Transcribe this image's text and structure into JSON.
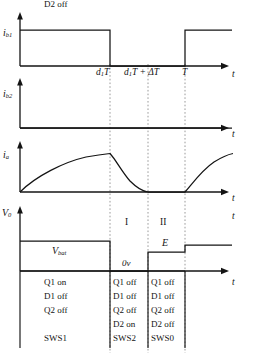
{
  "figure": {
    "kind": "timing-waveform-diagram",
    "colors": {
      "ink": "#141414",
      "dotted": "#8a8a8a",
      "background": "#ffffff"
    },
    "time_markers": [
      {
        "id": "d1T",
        "label_main": "d",
        "label_sub": "1",
        "label_tail": "T",
        "x": 110
      },
      {
        "id": "d1T_dT",
        "label_main": "d",
        "label_sub": "1",
        "label_tail": "T + ΔT",
        "x": 148
      },
      {
        "id": "T",
        "label_main": "T",
        "label_sub": "",
        "label_tail": "",
        "x": 185
      }
    ],
    "axis_t_label": "t"
  },
  "traces": [
    {
      "name": "ib1",
      "y_axis_label_main": "i",
      "y_axis_label_sub": "b1",
      "t_label": "t",
      "description": "gate drive pulse, high from 0 to d1T, low until T, high after T",
      "segments": [
        {
          "from": 0.0,
          "to": 0.5,
          "level": "high"
        },
        {
          "from": 0.5,
          "to": 1.0,
          "level": "low"
        },
        {
          "from": 1.0,
          "to": 1.3,
          "level": "high"
        }
      ],
      "tick_labels": [
        "d1T",
        "d1T + ΔT",
        "T"
      ]
    },
    {
      "name": "ib2",
      "y_axis_label_main": "i",
      "y_axis_label_sub": "b2",
      "t_label": "t",
      "description": "second gate drive, remains at zero for whole period",
      "segments": [
        {
          "from": 0.0,
          "to": 1.3,
          "level": "low"
        }
      ]
    },
    {
      "name": "ia",
      "y_axis_label_main": "i",
      "y_axis_label_sub": "a",
      "t_label": "t",
      "description": "inductor current: exponential rise 0 to d1T, exponential decay to zero at d1T+dT, zero until T, exponential rise after T",
      "phases": [
        {
          "phase": "rise",
          "start_t": 0.0,
          "end_t": 0.5,
          "start_value": 0.0,
          "end_value": 1.0
        },
        {
          "phase": "decay",
          "start_t": 0.5,
          "end_t": 0.72,
          "start_value": 1.0,
          "end_value": 0.0
        },
        {
          "phase": "zero",
          "start_t": 0.72,
          "end_t": 1.0,
          "start_value": 0.0,
          "end_value": 0.0
        },
        {
          "phase": "rise",
          "start_t": 1.0,
          "end_t": 1.3,
          "start_value": 0.0,
          "end_value": 1.0
        }
      ]
    },
    {
      "name": "v0",
      "y_axis_label_main": "V",
      "y_axis_label_sub": "0",
      "t_label": "t",
      "description": "output voltage: V_bat level until d1T, 0v until d1T+dT, E level until T, then higher level",
      "levels": [
        {
          "label": "V_bat",
          "from_t": 0.0,
          "to_t": 0.5
        },
        {
          "label": "0v",
          "from_t": 0.5,
          "to_t": 0.72
        },
        {
          "label": "E",
          "from_t": 0.72,
          "to_t": 1.0
        },
        {
          "label": "",
          "from_t": 1.0,
          "to_t": 1.3
        }
      ],
      "annotations": {
        "vbat_main": "V",
        "vbat_sub": "bat",
        "zero_volt": "0v",
        "e_level": "E"
      }
    }
  ],
  "regions": [
    {
      "id": "region-I",
      "label": "I"
    },
    {
      "id": "region-II",
      "label": "II"
    }
  ],
  "switch_table": {
    "columns": [
      {
        "id": "col-1",
        "region": "0 to d1T",
        "rows": [
          "Q1 on",
          "D1 off",
          "Q2 off",
          "D2 off",
          "SWS1"
        ]
      },
      {
        "id": "col-2",
        "region": "I",
        "rows": [
          "Q1 off",
          "D1 off",
          "Q2 off",
          "D2 on",
          "SWS2"
        ]
      },
      {
        "id": "col-3",
        "region": "II",
        "rows": [
          "Q1 off",
          "D1 off",
          "Q2 off",
          "D2 off",
          "SWS0"
        ]
      }
    ]
  }
}
